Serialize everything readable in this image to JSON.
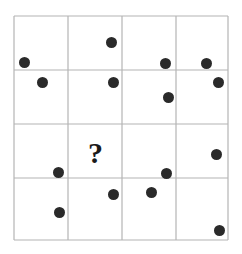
{
  "puzzle": {
    "type": "dot-pattern-matrix",
    "question_mark": "?",
    "canvas": {
      "width": 242,
      "height": 254,
      "background": "#ffffff"
    },
    "grid": {
      "x_lines": [
        14,
        68,
        122,
        176,
        228
      ],
      "y_lines": [
        16,
        70,
        124,
        178,
        240
      ],
      "rows": 4,
      "cols": 4,
      "line_color": "#b4b4b4",
      "line_width": 1.2
    },
    "dot_style": {
      "color": "#2a2a2a",
      "diameter": 11
    },
    "dots": [
      {
        "cell": "r1c1",
        "cx": 24,
        "cy": 62,
        "d": 11
      },
      {
        "cell": "r1c2",
        "cx": 111,
        "cy": 42,
        "d": 11
      },
      {
        "cell": "r1c3",
        "cx": 165,
        "cy": 63,
        "d": 11
      },
      {
        "cell": "r1c4",
        "cx": 206,
        "cy": 63,
        "d": 11
      },
      {
        "cell": "r2c1",
        "cx": 42,
        "cy": 82,
        "d": 11
      },
      {
        "cell": "r2c2",
        "cx": 113,
        "cy": 82,
        "d": 11
      },
      {
        "cell": "r2c3",
        "cx": 168,
        "cy": 97,
        "d": 11
      },
      {
        "cell": "r2c4",
        "cx": 218,
        "cy": 82,
        "d": 11
      },
      {
        "cell": "r3c1",
        "cx": 58,
        "cy": 172,
        "d": 11
      },
      {
        "cell": "r3c3",
        "cx": 166,
        "cy": 173,
        "d": 11
      },
      {
        "cell": "r3c4",
        "cx": 216,
        "cy": 154,
        "d": 11
      },
      {
        "cell": "r4c1",
        "cx": 59,
        "cy": 212,
        "d": 11
      },
      {
        "cell": "r4c2",
        "cx": 113,
        "cy": 194,
        "d": 11
      },
      {
        "cell": "r4c3",
        "cx": 151,
        "cy": 192,
        "d": 11
      },
      {
        "cell": "r4c4",
        "cx": 219,
        "cy": 230,
        "d": 11
      }
    ],
    "question_mark_mark": {
      "cell": "r3c2",
      "x": 88,
      "y": 138,
      "font_size": 30
    }
  }
}
